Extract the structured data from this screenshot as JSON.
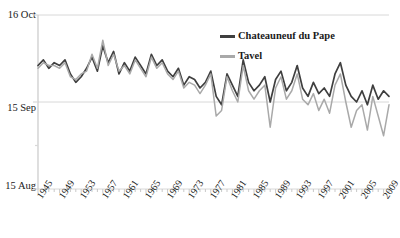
{
  "chart_data": {
    "type": "line",
    "title": "",
    "xlabel": "",
    "ylabel": "",
    "grid": true,
    "legend_position": "top-right",
    "x_start": 1945,
    "x_end": 2010,
    "xlim": [
      1945,
      2010
    ],
    "ylim": [
      0,
      62
    ],
    "y_axis_note": "Harvest date; 0 = 15 Aug, 31 = 15 Sep, 62 = 16 Oct",
    "yticks": [
      0,
      31,
      62
    ],
    "ytick_labels": [
      "15 Aug",
      "15 Sep",
      "16 Oct"
    ],
    "yminor_ticks": [
      15.5
    ],
    "xticks": [
      1945,
      1949,
      1953,
      1957,
      1961,
      1965,
      1969,
      1973,
      1977,
      1981,
      1985,
      1989,
      1993,
      1997,
      2001,
      2005,
      2009
    ],
    "xtick_labels": [
      "1945",
      "1949",
      "1953",
      "1957",
      "1961",
      "1965",
      "1969",
      "1973",
      "1977",
      "1981",
      "1985",
      "1989",
      "1993",
      "1997",
      "2001",
      "2005",
      "2009"
    ],
    "colors": {
      "chateauneuf": "#3f3f3f",
      "tavel": "#a9a9a9",
      "grid": "#d8d8d8",
      "axis": "#c9c9c9",
      "background": "#ffffff"
    },
    "series": [
      {
        "name": "Chateauneuf du Pape",
        "color": "#3f3f3f",
        "values": [
          44,
          46,
          43,
          45,
          44,
          46,
          41,
          38,
          40,
          43,
          47,
          42,
          51,
          45,
          49,
          41,
          45,
          42,
          47,
          44,
          41,
          48,
          44,
          46,
          42,
          40,
          43,
          37,
          40,
          39,
          36,
          38,
          42,
          33,
          30,
          41,
          37,
          33,
          46,
          38,
          35,
          37,
          40,
          31,
          39,
          42,
          35,
          38,
          44,
          36,
          33,
          38,
          34,
          36,
          33,
          41,
          45,
          37,
          33,
          31,
          35,
          30,
          37,
          32,
          35,
          33
        ]
      },
      {
        "name": "Tavel",
        "color": "#a9a9a9",
        "values": [
          43,
          45,
          44,
          44,
          43,
          45,
          40,
          39,
          41,
          42,
          48,
          43,
          53,
          44,
          48,
          42,
          44,
          41,
          46,
          43,
          40,
          47,
          43,
          45,
          41,
          39,
          42,
          36,
          38,
          37,
          34,
          37,
          41,
          26,
          28,
          40,
          35,
          31,
          44,
          35,
          32,
          35,
          37,
          22,
          36,
          40,
          32,
          35,
          41,
          32,
          30,
          34,
          28,
          32,
          27,
          37,
          41,
          31,
          22,
          28,
          30,
          21,
          33,
          26,
          19,
          30
        ]
      }
    ]
  },
  "axis": {
    "y_labels": [
      "16 Oct",
      "15 Sep",
      "15 Aug"
    ],
    "x_labels": [
      "1945",
      "1949",
      "1953",
      "1957",
      "1961",
      "1965",
      "1969",
      "1973",
      "1977",
      "1981",
      "1985",
      "1989",
      "1993",
      "1997",
      "2001",
      "2005",
      "2009"
    ]
  },
  "legend": {
    "items": [
      {
        "label": "Chateauneuf du Pape",
        "color": "#3f3f3f"
      },
      {
        "label": "Tavel",
        "color": "#a9a9a9"
      }
    ]
  }
}
